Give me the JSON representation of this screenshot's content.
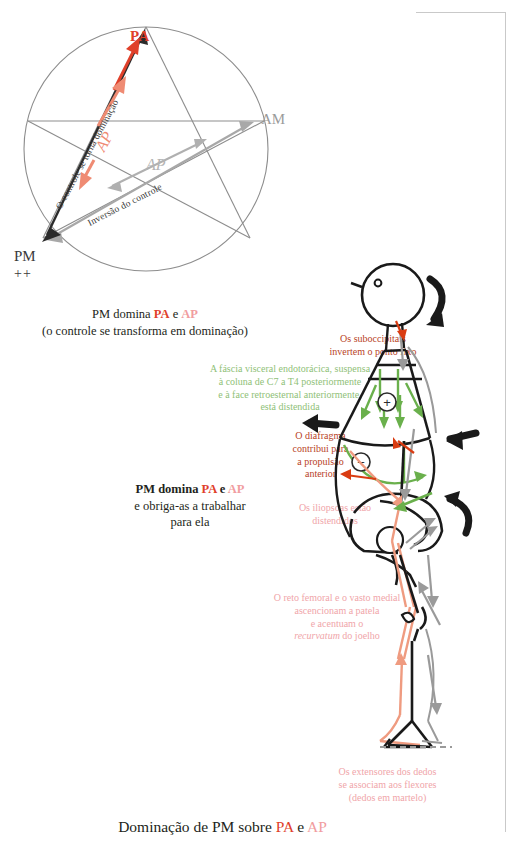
{
  "star_diagram": {
    "name": "star-pentagram-diagram",
    "vertices": {
      "top": "PA",
      "right": "AM",
      "bottom_left": "PM",
      "bottom_left_sub": "++"
    },
    "inner_label_grey": "AP",
    "inner_label_red": "AP",
    "arrow_labels": {
      "dominance": "O controle se torna dominação",
      "inversion": "Inversão do controle"
    }
  },
  "captions": {
    "caption1_line1_prefix": "PM domina ",
    "caption1_pa": "PA",
    "caption1_middle": " e ",
    "caption1_ap": "AP",
    "caption1_line2": "(o controle se transforma em dominação)",
    "caption2_line1_prefix": "PM domina ",
    "caption2_pa": "PA",
    "caption2_middle": " e ",
    "caption2_ap": "AP",
    "caption2_line2": "e obriga-as a trabalhar",
    "caption2_line3": "para ela"
  },
  "bottom_title": {
    "prefix": "Dominação de PM sobre ",
    "pa": "PA",
    "middle": " e ",
    "ap": "AP"
  },
  "annotations": {
    "suboccipitais": {
      "line1": "Os suboccipitais",
      "line2": "invertem o ponto fixo",
      "color": "#b8431f"
    },
    "fascia": {
      "line1": "A fáscia visceral endotorácica, suspensa",
      "line2": "à coluna de C7 a T4 posteriormente",
      "line3": "e à face retroesternal anteriormente,",
      "line4": "está distendida",
      "color": "#8fbf78"
    },
    "diafragma": {
      "line1": "O diafragma",
      "line2": "contribui para",
      "line3": "a propulsão",
      "line4": "anterior",
      "color": "#b8431f"
    },
    "iliopsoas": {
      "line1": "Os iliopsoas estão",
      "line2": "distendidos",
      "color": "#f0a5a9"
    },
    "reto_femoral": {
      "line1": "O reto femoral e o vasto medial",
      "line2": "ascencionam a patela",
      "line3": "e acentuam o",
      "line4_italic": "recurvatum",
      "line4_rest": " do joelho",
      "color": "#f0a5a9"
    },
    "extensores": {
      "line1": "Os extensores dos dedos",
      "line2": "se associam aos flexores",
      "line3": "(dedos em martelo)",
      "color": "#f0a5a9"
    }
  },
  "figure_signs": {
    "thorax_sign": "+",
    "abdomen_sign": "−"
  },
  "colors": {
    "red": "#e0402a",
    "pink": "#f0a5a9",
    "salmon": "#ef8b73",
    "green": "#6ab04c",
    "grey": "#9b9b9b",
    "ink": "#231f20",
    "brick": "#b8431f"
  }
}
